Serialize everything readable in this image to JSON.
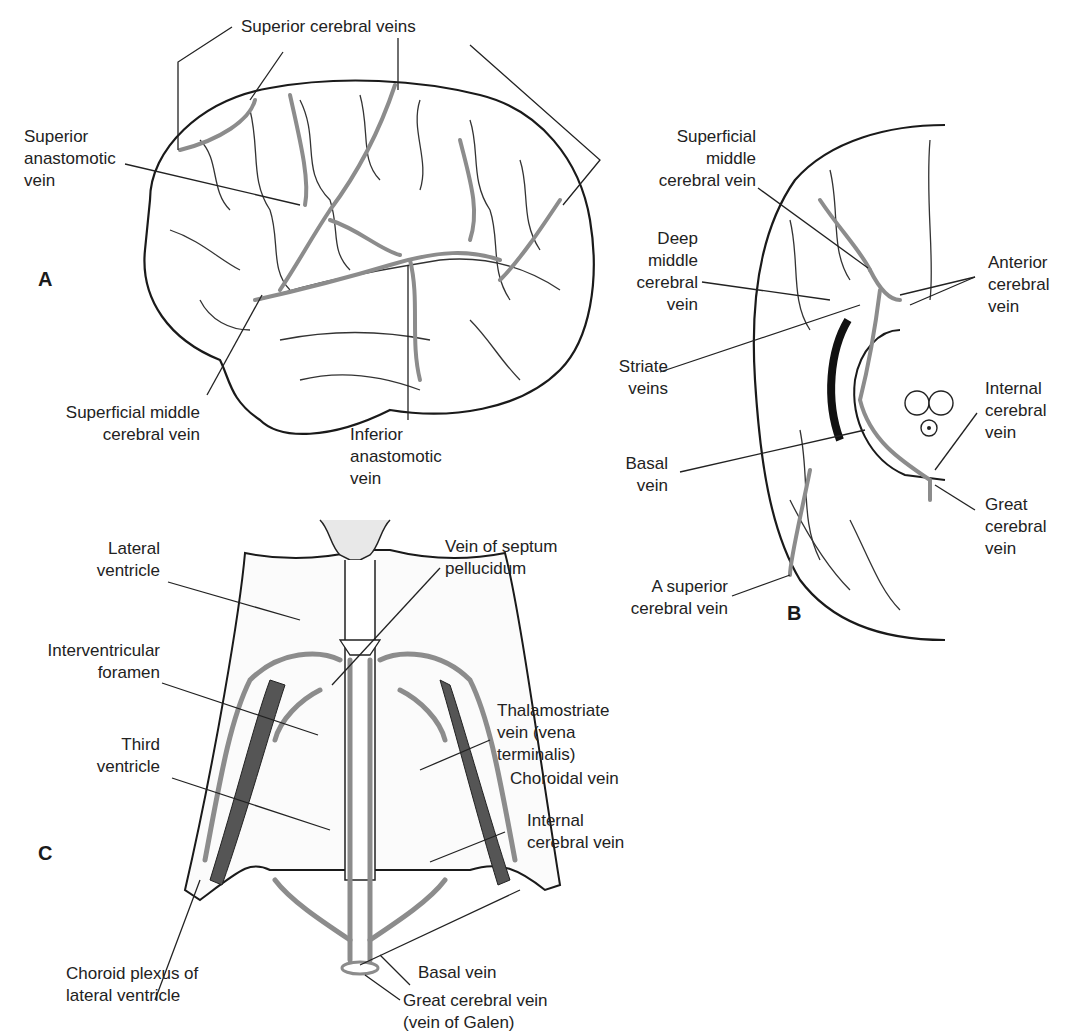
{
  "figure": {
    "vein_color": "#8c8c8c",
    "line_color": "#222222",
    "panels": [
      {
        "id": "A",
        "letter": "A",
        "view": "lateral brain surface",
        "labels": [
          "Superior cerebral veins",
          "Superior\nanastomotic\nvein",
          "Superficial middle\ncerebral vein",
          "Inferior\nanastomotic\nvein"
        ]
      },
      {
        "id": "B",
        "letter": "B",
        "view": "inferior brain surface",
        "labels": [
          "Superficial\nmiddle\ncerebral vein",
          "Deep\nmiddle\ncerebral\nvein",
          "Anterior\ncerebral\nvein",
          "Striate\nveins",
          "Internal\ncerebral\nvein",
          "Basal\nvein",
          "Great\ncerebral\nvein",
          "A superior\ncerebral vein"
        ]
      },
      {
        "id": "C",
        "letter": "C",
        "view": "ventricles from above",
        "labels": [
          "Lateral\nventricle",
          "Vein of septum\npellucidum",
          "Interventricular\nforamen",
          "Thalamostriate\nvein (vena\nterminalis)",
          "Third\nventricle",
          "Choroidal vein",
          "Internal\ncerebral vein",
          "Choroid plexus of\nlateral ventricle",
          "Basal vein",
          "Great cerebral vein\n(vein of Galen)"
        ]
      }
    ]
  }
}
